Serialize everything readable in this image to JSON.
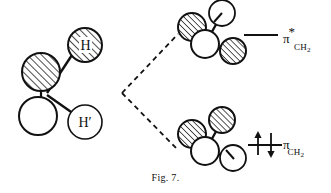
{
  "figure": {
    "caption": "Fig. 7.",
    "background_color": "#ffffff",
    "ink_color": "#111111"
  },
  "reactant": {
    "name": "methylene-fragment-with-p-orbital",
    "orbital_lobes": [
      {
        "name": "upper-lobe",
        "fill": "hatched",
        "cx": 41,
        "cy": 72,
        "r": 19
      },
      {
        "name": "lower-lobe",
        "fill": "white",
        "cx": 38,
        "cy": 116,
        "r": 19
      }
    ],
    "substituents": [
      {
        "name": "hydrogen-upper",
        "label": "H",
        "fill": "hatched",
        "cx": 85,
        "cy": 45,
        "r": 17
      },
      {
        "name": "hydrogen-lower",
        "label": "H'",
        "fill": "white",
        "cx": 85,
        "cy": 122,
        "r": 17
      }
    ]
  },
  "connector": {
    "name": "dashed-correlation-lines",
    "style": "dashed",
    "vertex": {
      "x": 122,
      "y": 93
    },
    "upper_end": {
      "x": 178,
      "y": 34
    },
    "lower_end": {
      "x": 178,
      "y": 150
    }
  },
  "products": [
    {
      "name": "upper-methylene-cluster",
      "spheres": [
        {
          "name": "sphere-left",
          "fill": "hatched",
          "cx": 192,
          "cy": 27,
          "r": 14
        },
        {
          "name": "sphere-upper-right",
          "fill": "white",
          "cx": 222,
          "cy": 13,
          "r": 13
        },
        {
          "name": "sphere-center",
          "fill": "white",
          "cx": 205,
          "cy": 44,
          "r": 14
        },
        {
          "name": "sphere-lower-right",
          "fill": "hatched",
          "cx": 233,
          "cy": 51,
          "r": 13
        }
      ]
    },
    {
      "name": "lower-methylene-cluster",
      "spheres": [
        {
          "name": "sphere-left",
          "fill": "hatched",
          "cx": 192,
          "cy": 134,
          "r": 14
        },
        {
          "name": "sphere-upper-right",
          "fill": "hatched",
          "cx": 222,
          "cy": 120,
          "r": 13
        },
        {
          "name": "sphere-center",
          "fill": "white",
          "cx": 205,
          "cy": 151,
          "r": 14
        },
        {
          "name": "sphere-lower-right",
          "fill": "white",
          "cx": 233,
          "cy": 158,
          "r": 13
        }
      ]
    }
  ],
  "orbital_diagram": {
    "levels": [
      {
        "name": "pi-star-antibonding-level",
        "pi": "π",
        "star": "*",
        "subscript_ch": "CH",
        "subscript_number": "2",
        "occupancy": 0,
        "electrons": [],
        "line": {
          "x1": 244,
          "y1": 35,
          "x2": 278,
          "y2": 35
        }
      },
      {
        "name": "pi-bonding-level",
        "pi": "π",
        "star": "",
        "subscript_ch": "CH",
        "subscript_number": "2",
        "occupancy": 2,
        "electrons": [
          "spin-up",
          "spin-down"
        ],
        "line": {
          "x1": 248,
          "y1": 145,
          "x2": 282,
          "y2": 145
        }
      }
    ]
  }
}
